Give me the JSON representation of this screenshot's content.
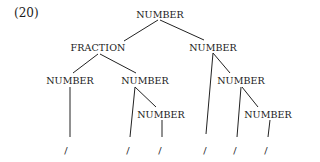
{
  "example_number": "(20)",
  "tree": {
    "nodes": [
      {
        "id": "n0",
        "label": "NUMBER",
        "x": 160,
        "y": 14
      },
      {
        "id": "n1",
        "label": "FRACTION",
        "x": 98,
        "y": 47
      },
      {
        "id": "n2",
        "label": "NUMBER",
        "x": 213,
        "y": 47
      },
      {
        "id": "n3",
        "label": "NUMBER",
        "x": 70,
        "y": 80
      },
      {
        "id": "n4",
        "label": "NUMBER",
        "x": 145,
        "y": 80
      },
      {
        "id": "n5",
        "label": "NUMBER",
        "x": 241,
        "y": 80
      },
      {
        "id": "n6",
        "label": "NUMBER",
        "x": 161,
        "y": 114
      },
      {
        "id": "n7",
        "label": "NUMBER",
        "x": 268,
        "y": 114
      }
    ],
    "leaves": [
      {
        "id": "l0",
        "label": "/",
        "x": 66,
        "y": 150
      },
      {
        "id": "l1",
        "label": "/",
        "x": 128,
        "y": 150
      },
      {
        "id": "l2",
        "label": "/",
        "x": 160,
        "y": 150
      },
      {
        "id": "l3",
        "label": "/",
        "x": 205,
        "y": 150
      },
      {
        "id": "l4",
        "label": "/",
        "x": 235,
        "y": 150
      },
      {
        "id": "l5",
        "label": "/",
        "x": 266,
        "y": 150
      }
    ],
    "edges": [
      {
        "from": [
          158,
          20
        ],
        "to": [
          124,
          41
        ]
      },
      {
        "from": [
          160,
          20
        ],
        "to": [
          204,
          40
        ]
      },
      {
        "from": [
          98,
          54
        ],
        "to": [
          73,
          73
        ]
      },
      {
        "from": [
          100,
          54
        ],
        "to": [
          136,
          73
        ]
      },
      {
        "from": [
          70,
          87
        ],
        "to": [
          70,
          137
        ]
      },
      {
        "from": [
          135,
          87
        ],
        "to": [
          130,
          137
        ]
      },
      {
        "from": [
          135,
          87
        ],
        "to": [
          156,
          107
        ]
      },
      {
        "from": [
          162,
          120
        ],
        "to": [
          162,
          137
        ]
      },
      {
        "from": [
          213,
          53
        ],
        "to": [
          206,
          134
        ]
      },
      {
        "from": [
          213,
          53
        ],
        "to": [
          230,
          73
        ]
      },
      {
        "from": [
          241,
          87
        ],
        "to": [
          237,
          137
        ]
      },
      {
        "from": [
          242,
          87
        ],
        "to": [
          258,
          107
        ]
      },
      {
        "from": [
          270,
          120
        ],
        "to": [
          268,
          137
        ]
      }
    ]
  }
}
